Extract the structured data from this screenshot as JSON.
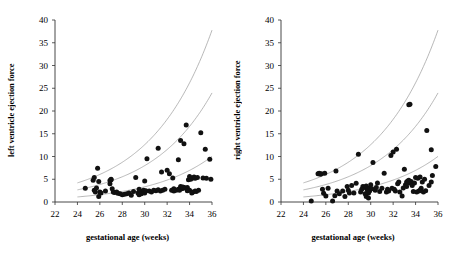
{
  "figure": {
    "background": "#ffffff",
    "marker_color": "#111111",
    "curve_color": "#9a9a9a",
    "axis_color": "#333333"
  },
  "chart_data": [
    {
      "type": "scatter",
      "panel": "left",
      "title": "",
      "xlabel": "gestational age (weeks)",
      "ylabel": "left ventricle ejection force",
      "xlim": [
        22,
        36
      ],
      "ylim": [
        0,
        40
      ],
      "xticks": [
        22,
        24,
        26,
        28,
        30,
        32,
        34,
        36
      ],
      "yticks": [
        0,
        5,
        10,
        15,
        20,
        25,
        30,
        35,
        40
      ],
      "grid": false,
      "legend": "none",
      "x": [
        24.7,
        25.4,
        25.5,
        25.5,
        25.6,
        25.7,
        25.8,
        25.9,
        25.9,
        26.0,
        26.1,
        26.5,
        26.9,
        27.0,
        27.0,
        27.1,
        27.2,
        27.3,
        27.5,
        27.6,
        27.8,
        28.0,
        28.2,
        28.4,
        28.6,
        28.8,
        29.0,
        29.2,
        29.4,
        29.5,
        29.6,
        29.7,
        29.8,
        29.9,
        30.0,
        30.1,
        30.2,
        30.4,
        30.6,
        30.8,
        31.0,
        31.2,
        31.4,
        31.5,
        31.6,
        31.8,
        32.0,
        32.2,
        32.4,
        32.5,
        32.6,
        32.8,
        33.0,
        33.0,
        33.1,
        33.2,
        33.3,
        33.4,
        33.5,
        33.5,
        33.6,
        33.7,
        33.8,
        33.8,
        33.9,
        34.0,
        34.0,
        34.1,
        34.2,
        34.3,
        34.3,
        34.4,
        34.5,
        34.5,
        34.6,
        34.7,
        34.8,
        35.0,
        35.2,
        35.4,
        35.5,
        35.8,
        35.9,
        33.2,
        33.4,
        32.6,
        31.2,
        30.0,
        29.5,
        26.9
      ],
      "y": [
        3.0,
        4.8,
        5.4,
        2.6,
        2.2,
        3.1,
        7.4,
        1.2,
        4.5,
        2.2,
        2.0,
        2.4,
        4.7,
        5.0,
        4.9,
        2.9,
        2.2,
        2.1,
        2.2,
        1.9,
        1.8,
        1.6,
        1.7,
        1.8,
        2.0,
        1.5,
        2.3,
        5.4,
        2.0,
        1.6,
        2.4,
        1.8,
        2.2,
        2.6,
        2.0,
        2.5,
        9.5,
        2.4,
        2.2,
        2.6,
        2.5,
        11.8,
        2.4,
        6.6,
        2.6,
        2.8,
        7.0,
        6.2,
        2.6,
        5.3,
        2.4,
        2.6,
        9.3,
        2.8,
        2.6,
        13.5,
        2.9,
        3.0,
        12.8,
        3.2,
        3.1,
        16.9,
        2.5,
        3.2,
        4.9,
        2.6,
        5.6,
        5.0,
        2.0,
        5.3,
        2.2,
        5.5,
        2.4,
        5.2,
        2.3,
        5.4,
        2.6,
        15.2,
        5.3,
        11.6,
        5.2,
        9.4,
        5.0,
        3.4,
        3.3,
        2.9,
        2.7,
        4.6,
        2.8,
        4.0
      ],
      "curves": [
        {
          "name": "upper-reference-curve",
          "a": 0.052,
          "b": 0.183,
          "x_start": 24.0,
          "x_end": 36.0
        },
        {
          "name": "middle-reference-curve",
          "a": 0.033,
          "b": 0.183,
          "x_start": 24.0,
          "x_end": 36.0
        },
        {
          "name": "lower-reference-curve",
          "a": 0.0138,
          "b": 0.183,
          "x_start": 24.0,
          "x_end": 36.0
        }
      ]
    },
    {
      "type": "scatter",
      "panel": "right",
      "title": "",
      "xlabel": "gestational age (weeks)",
      "ylabel": "right ventricle ejection force",
      "xlim": [
        22,
        36
      ],
      "ylim": [
        0,
        40
      ],
      "xticks": [
        22,
        24,
        26,
        28,
        30,
        32,
        34,
        36
      ],
      "yticks": [
        0,
        5,
        10,
        15,
        20,
        25,
        30,
        35,
        40
      ],
      "grid": false,
      "legend": "none",
      "x": [
        24.7,
        25.3,
        25.4,
        25.5,
        25.6,
        25.7,
        25.8,
        25.9,
        26.0,
        26.2,
        26.6,
        26.9,
        27.0,
        27.2,
        27.5,
        27.7,
        27.9,
        28.1,
        28.3,
        28.5,
        28.7,
        28.9,
        29.1,
        29.3,
        29.4,
        29.5,
        29.5,
        29.6,
        29.6,
        29.7,
        29.8,
        29.9,
        30.0,
        30.2,
        30.4,
        30.6,
        30.8,
        31.0,
        31.2,
        31.4,
        31.6,
        31.8,
        32.0,
        32.2,
        32.3,
        32.4,
        32.5,
        32.6,
        32.8,
        33.0,
        33.1,
        33.2,
        33.3,
        33.4,
        33.5,
        33.5,
        33.6,
        33.7,
        33.8,
        33.9,
        34.0,
        34.1,
        34.2,
        34.3,
        34.4,
        34.5,
        34.6,
        34.7,
        34.8,
        35.0,
        35.2,
        35.4,
        35.5,
        35.8,
        29.2,
        30.5,
        31.9,
        32.1,
        33.2,
        34.4,
        29.9,
        30.1,
        32.9,
        33.4,
        34.9,
        35.4,
        26.8,
        28.0,
        29.8,
        31.5
      ],
      "y": [
        0.2,
        6.2,
        6.3,
        6.1,
        6.2,
        2.8,
        1.9,
        6.3,
        1.3,
        3.0,
        0.2,
        6.8,
        2.4,
        1.8,
        2.4,
        1.2,
        3.4,
        2.0,
        3.6,
        2.0,
        4.1,
        10.5,
        2.2,
        3.4,
        3.3,
        1.8,
        3.2,
        1.2,
        3.5,
        2.6,
        0.9,
        3.1,
        3.8,
        8.7,
        2.6,
        4.2,
        2.3,
        3.0,
        6.3,
        2.2,
        2.4,
        10.2,
        11.0,
        2.4,
        11.6,
        4.0,
        4.4,
        2.2,
        1.3,
        7.2,
        3.8,
        4.4,
        4.6,
        21.4,
        21.5,
        4.2,
        4.5,
        3.6,
        2.3,
        4.2,
        5.4,
        2.2,
        5.2,
        2.4,
        5.5,
        3.0,
        4.4,
        2.2,
        5.0,
        15.7,
        3.6,
        11.5,
        5.8,
        7.8,
        2.8,
        3.2,
        3.0,
        2.8,
        3.4,
        2.6,
        2.4,
        2.9,
        3.1,
        4.8,
        2.5,
        4.4,
        1.4,
        2.6,
        2.0,
        2.8
      ],
      "curves": [
        {
          "name": "upper-reference-curve",
          "a": 0.052,
          "b": 0.183,
          "x_start": 24.0,
          "x_end": 36.0
        },
        {
          "name": "middle-reference-curve",
          "a": 0.033,
          "b": 0.183,
          "x_start": 24.0,
          "x_end": 36.0
        },
        {
          "name": "lower-reference-curve",
          "a": 0.0138,
          "b": 0.183,
          "x_start": 24.0,
          "x_end": 36.0
        }
      ]
    }
  ]
}
